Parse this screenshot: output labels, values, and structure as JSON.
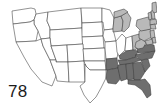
{
  "figure": {
    "label": "78",
    "type": "choropleth-map",
    "region": "United States (contiguous 48 states)",
    "background_color": "#ffffff",
    "border_color": "#3a3a3a"
  },
  "legend_colors": {
    "none": "#ffffff",
    "light": "#b9b9b9",
    "dark": "#6e6e6e",
    "darkest": "#4f4f4f"
  },
  "chart_data": {
    "type": "heatmap",
    "title": "78",
    "xlabel": "",
    "ylabel": "",
    "categories": [
      "WA",
      "OR",
      "CA",
      "NV",
      "ID",
      "MT",
      "WY",
      "UT",
      "AZ",
      "CO",
      "NM",
      "ND",
      "SD",
      "NE",
      "KS",
      "OK",
      "TX",
      "MN",
      "IA",
      "MO",
      "AR",
      "LA",
      "WI",
      "IL",
      "MI",
      "IN",
      "OH",
      "KY",
      "TN",
      "MS",
      "AL",
      "GA",
      "FL",
      "SC",
      "NC",
      "VA",
      "WV",
      "PA",
      "NY",
      "NJ",
      "DE",
      "MD",
      "CT",
      "RI",
      "MA",
      "VT",
      "NH",
      "ME"
    ],
    "values": [
      0,
      0,
      0,
      0,
      0,
      0,
      0,
      0,
      0,
      0,
      0,
      0,
      0,
      0,
      0,
      0,
      0,
      0,
      0,
      0,
      2,
      2,
      1,
      0,
      1,
      0,
      1,
      2,
      2,
      2,
      2,
      2,
      2,
      2,
      2,
      2,
      1,
      1,
      1,
      1,
      1,
      1,
      1,
      1,
      1,
      1,
      1,
      1
    ],
    "value_labels": [
      "unshaded",
      "light gray",
      "dark gray"
    ],
    "grid": false,
    "legend_position": "none"
  },
  "states": [
    {
      "name": "WA",
      "shade": "none",
      "points": "12,11 31,8 35,9 36,14 34,20 30,22 13,24"
    },
    {
      "name": "ID",
      "shade": "none",
      "points": "36,14 48,12 47,21 50,28 50,38 41,39 38,31 34,24 34,20"
    },
    {
      "name": "MT",
      "shade": "none",
      "points": "48,12 81,8 82,28 50,30 50,28 47,21"
    },
    {
      "name": "OR",
      "shade": "none",
      "points": "13,24 30,22 34,20 34,24 38,31 36,41 16,42"
    },
    {
      "name": "WY",
      "shade": "none",
      "points": "50,30 82,28 83,44 51,46 50,38"
    },
    {
      "name": "ND",
      "shade": "none",
      "points": "81,8 102,8 102,22 82,23"
    },
    {
      "name": "SD",
      "shade": "none",
      "points": "82,23 102,22 103,36 82,37"
    },
    {
      "name": "NE",
      "shade": "none",
      "points": "82,37 103,36 104,48 83,49"
    },
    {
      "name": "CA",
      "shade": "none",
      "points": "16,42 36,41 41,39 43,46 50,60 56,76 52,86 42,82 31,69 24,57"
    },
    {
      "name": "NV",
      "shade": "none",
      "points": "41,39 50,38 51,46 56,60 50,60 43,46"
    },
    {
      "name": "UT",
      "shade": "none",
      "points": "51,46 67,45 68,62 56,62 56,60 51,46"
    },
    {
      "name": "CO",
      "shade": "none",
      "points": "67,45 83,44 84,61 68,62"
    },
    {
      "name": "AZ",
      "shade": "none",
      "points": "56,62 68,62 69,82 57,81 56,76 50,60 56,60"
    },
    {
      "name": "NM",
      "shade": "none",
      "points": "68,62 84,61 85,82 69,82"
    },
    {
      "name": "KS",
      "shade": "none",
      "points": "83,49 105,48 105,61 84,61"
    },
    {
      "name": "OK",
      "shade": "none",
      "points": "84,61 105,61 106,70 90,70 86,66 85,64"
    },
    {
      "name": "TX",
      "shade": "none",
      "points": "85,82 85,64 86,66 90,70 106,70 106,78 101,88 96,97 90,103 84,95 80,86"
    },
    {
      "name": "MN",
      "shade": "none",
      "points": "102,8 110,10 114,18 113,29 104,30 103,22 102,22"
    },
    {
      "name": "IA",
      "shade": "none",
      "points": "104,30 113,29 116,41 105,42 103,36"
    },
    {
      "name": "MO",
      "shade": "none",
      "points": "105,42 116,41 119,48 117,58 106,59 105,48"
    },
    {
      "name": "WI",
      "shade": "light",
      "points": "114,18 121,16 123,21 122,31 113,32 113,29"
    },
    {
      "name": "IL",
      "shade": "none",
      "points": "116,41 122,34 126,38 125,50 119,56 117,52"
    },
    {
      "name": "MI",
      "shade": "light",
      "points": "121,16 127,12 131,18 129,27 124,32 122,31 123,21"
    },
    {
      "name": "MI-UP",
      "shade": "light",
      "points": "114,12 124,9 128,12 121,16 114,18"
    },
    {
      "name": "IN",
      "shade": "none",
      "points": "126,38 132,36 133,50 126,51 125,50"
    },
    {
      "name": "OH",
      "shade": "light",
      "points": "132,36 139,34 141,45 135,50 133,50"
    },
    {
      "name": "AR",
      "shade": "dark",
      "points": "106,59 117,58 118,68 107,70 106,70"
    },
    {
      "name": "LA",
      "shade": "dark",
      "points": "107,70 118,68 121,78 116,84 108,83 106,78"
    },
    {
      "name": "KY",
      "shade": "dark",
      "points": "119,56 126,51 133,50 138,51 136,57 126,60 120,59"
    },
    {
      "name": "TN",
      "shade": "dark",
      "points": "118,60 126,60 136,57 141,60 130,64 120,65"
    },
    {
      "name": "MS",
      "shade": "dark",
      "points": "118,65 126,64 127,79 121,81 120,78 118,68"
    },
    {
      "name": "AL",
      "shade": "dark",
      "points": "126,64 133,63 134,79 128,80 127,79"
    },
    {
      "name": "GA",
      "shade": "dark",
      "points": "133,63 141,62 145,72 140,80 134,80"
    },
    {
      "name": "FL",
      "shade": "dark",
      "points": "128,80 140,80 145,79 150,85 151,95 147,98 142,90 135,85 128,84"
    },
    {
      "name": "SC",
      "shade": "dark",
      "points": "141,60 148,59 150,66 145,72"
    },
    {
      "name": "NC",
      "shade": "dark",
      "points": "135,55 148,52 155,51 152,58 141,60"
    },
    {
      "name": "VA",
      "shade": "dark",
      "points": "137,48 148,44 154,45 155,51 148,52 138,53"
    },
    {
      "name": "WV",
      "shade": "light",
      "points": "136,42 142,39 146,43 143,48 138,49 135,47"
    },
    {
      "name": "PA",
      "shade": "light",
      "points": "139,31 150,29 152,37 144,41 139,38"
    },
    {
      "name": "NY",
      "shade": "light",
      "points": "137,20 148,17 152,22 151,29 141,31 136,26"
    },
    {
      "name": "NJ",
      "shade": "light",
      "points": "150,31 154,30 155,38 151,39"
    },
    {
      "name": "MD",
      "shade": "light",
      "points": "145,41 152,39 153,44 147,45"
    },
    {
      "name": "DE",
      "shade": "light",
      "points": "152,38 155,37 156,43 153,43"
    },
    {
      "name": "VT",
      "shade": "light",
      "points": "148,13 151,12 152,19 149,20"
    },
    {
      "name": "NH",
      "shade": "light",
      "points": "151,11 154,10 155,19 152,19"
    },
    {
      "name": "MA",
      "shade": "light",
      "points": "150,20 156,19 157,24 150,25"
    },
    {
      "name": "CT",
      "shade": "light",
      "points": "150,25 155,24 156,29 151,29"
    },
    {
      "name": "ME",
      "shade": "light",
      "points": "152,3 156,2 157,12 154,13 152,10"
    }
  ]
}
